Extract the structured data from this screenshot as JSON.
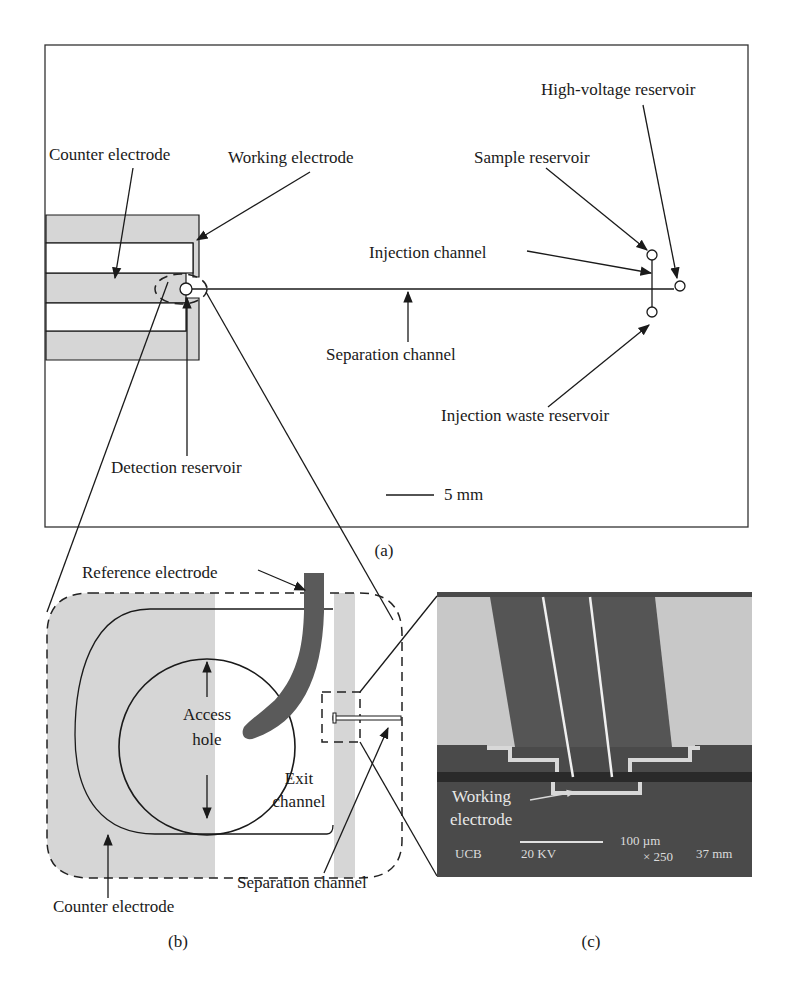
{
  "figure": {
    "panel_a": {
      "caption": "(a)",
      "labels": {
        "counter_electrode": "Counter electrode",
        "working_electrode": "Working electrode",
        "high_voltage_reservoir": "High-voltage reservoir",
        "sample_reservoir": "Sample reservoir",
        "injection_channel": "Injection channel",
        "separation_channel": "Separation channel",
        "injection_waste_reservoir": "Injection waste reservoir",
        "detection_reservoir": "Detection reservoir"
      },
      "scale_bar": "5 mm"
    },
    "panel_b": {
      "caption": "(b)",
      "labels": {
        "reference_electrode": "Reference electrode",
        "access_line1": "Access",
        "access_line2": "hole",
        "exit_line1": "Exit",
        "exit_line2": "channel",
        "counter_electrode": "Counter electrode",
        "separation_channel": "Separation channel"
      }
    },
    "panel_c": {
      "caption": "(c)",
      "labels": {
        "working_line1": "Working",
        "working_line2": "electrode"
      },
      "sem_info": {
        "lab": "UCB",
        "voltage": "20 KV",
        "scale": "100 µm",
        "magnification": "× 250",
        "working_distance": "37 mm"
      }
    }
  },
  "colors": {
    "electrode_fill": "#d6d6d6",
    "reference_electrode": "#5a5a5a",
    "sem_dark": "#4a4a4a",
    "sem_light": "#c8c8c8",
    "line": "#1a1a1a"
  }
}
